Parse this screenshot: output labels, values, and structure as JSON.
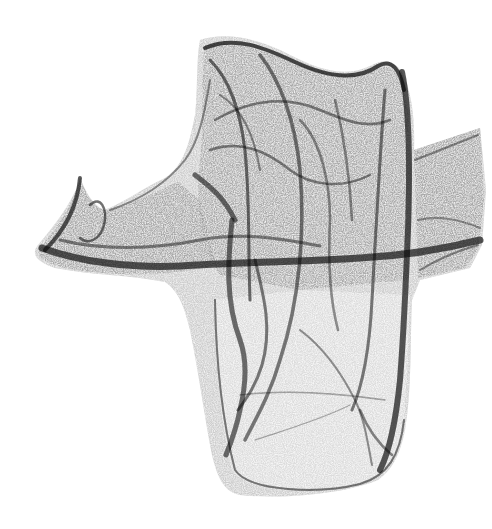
{
  "artwork": {
    "kind": "strange-attractor density render",
    "background": "#ffffff",
    "ink": "#111111",
    "silhouette_fill": "#9a9a9a",
    "text_elements": []
  }
}
